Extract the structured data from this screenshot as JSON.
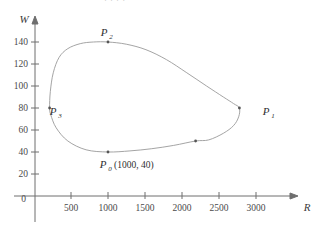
{
  "figure": {
    "cropped_header_text": "· · · ·"
  },
  "chart_data": {
    "type": "line",
    "title": "",
    "subtitle": "",
    "xlabel": "R",
    "ylabel": "W",
    "xlim": [
      0,
      3250
    ],
    "ylim": [
      0,
      155
    ],
    "grid": false,
    "legend": null,
    "xticks": [
      500,
      1000,
      1500,
      2000,
      2500,
      3000
    ],
    "xtick_labels": [
      "500",
      "1000",
      "1500",
      "2000",
      "2500",
      "3000"
    ],
    "yticks": [
      20,
      40,
      60,
      80,
      100,
      120,
      140
    ],
    "ytick_labels": [
      "20",
      "40",
      "60",
      "80",
      "100",
      "120",
      "140"
    ],
    "origin_label": "0",
    "series": [
      {
        "name": "closed trajectory",
        "closed": true,
        "color": "#9a9a9a",
        "points": [
          [
            1000,
            40
          ],
          [
            700,
            42
          ],
          [
            450,
            50
          ],
          [
            290,
            62
          ],
          [
            215,
            74
          ],
          [
            200,
            80
          ],
          [
            210,
            95
          ],
          [
            250,
            112
          ],
          [
            330,
            126
          ],
          [
            450,
            134
          ],
          [
            620,
            138.5
          ],
          [
            800,
            140
          ],
          [
            1000,
            140
          ],
          [
            1250,
            138
          ],
          [
            1520,
            133
          ],
          [
            1800,
            124
          ],
          [
            2080,
            112
          ],
          [
            2350,
            100
          ],
          [
            2580,
            90
          ],
          [
            2720,
            84
          ],
          [
            2800,
            80
          ],
          [
            2790,
            72
          ],
          [
            2720,
            64
          ],
          [
            2580,
            57
          ],
          [
            2380,
            51
          ],
          [
            2200,
            50
          ],
          [
            1900,
            46
          ],
          [
            1600,
            43
          ],
          [
            1300,
            41
          ],
          [
            1000,
            40
          ]
        ]
      }
    ],
    "annotations": [
      {
        "name": "P0",
        "base": "P",
        "subscript": "0",
        "coord_text": "(1000, 40)",
        "x": 1000,
        "y": 40,
        "label": "P₀ (1000, 40)",
        "label_position": "below"
      },
      {
        "name": "P1",
        "base": "P",
        "subscript": "1",
        "coord_text": "",
        "x": 2800,
        "y": 80,
        "label": "P₁",
        "label_position": "right"
      },
      {
        "name": "P2",
        "base": "P",
        "subscript": "2",
        "coord_text": "",
        "x": 1000,
        "y": 140,
        "label": "P₂",
        "label_position": "above"
      },
      {
        "name": "P3",
        "base": "P",
        "subscript": "3",
        "coord_text": "",
        "x": 200,
        "y": 80,
        "label": "P₃",
        "label_position": "right"
      },
      {
        "name": "unlabeled-marker",
        "base": "",
        "subscript": "",
        "coord_text": "",
        "x": 2200,
        "y": 50,
        "label": "",
        "label_position": "none"
      }
    ]
  }
}
